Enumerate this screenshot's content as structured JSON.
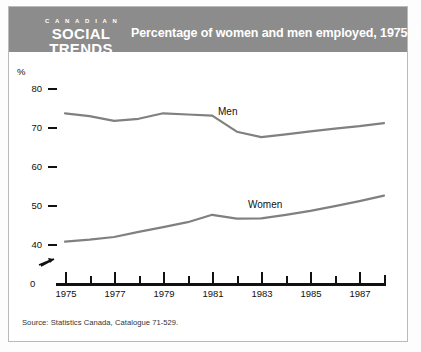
{
  "banner": {
    "logo_line1": "C A N A D I A N",
    "logo_line2": "SOCIAL",
    "logo_line3": "TRENDS",
    "title": "Percentage of women and men employed, 1975–1988",
    "background_color": "#8c8c8c",
    "text_color": "#ffffff"
  },
  "source": {
    "text": "Source: Statistics Canada, Catalogue 71-529."
  },
  "axis": {
    "y_unit": "%",
    "y_ticks": [
      "80",
      "70",
      "60",
      "50",
      "40"
    ],
    "zero_label": "0",
    "x_ticks_labeled": [
      "1975",
      "1977",
      "1979",
      "1981",
      "1983",
      "1985",
      "1987"
    ],
    "break_symbol": "axis-break"
  },
  "series_labels": {
    "men": "Men",
    "women": "Women"
  },
  "chart_data": {
    "type": "line",
    "title": "Percentage of women and men employed, 1975–1988",
    "xlabel": "",
    "ylabel": "%",
    "ylim": [
      40,
      80
    ],
    "xlim": [
      1975,
      1988
    ],
    "grid": false,
    "legend": "inline-labels",
    "axis_break": true,
    "x": [
      1975,
      1976,
      1977,
      1978,
      1979,
      1980,
      1981,
      1982,
      1983,
      1984,
      1985,
      1986,
      1987,
      1988
    ],
    "series": [
      {
        "name": "Men",
        "color": "#808080",
        "values": [
          73.5,
          72.8,
          71.6,
          72.1,
          73.5,
          73.2,
          72.9,
          68.8,
          67.4,
          68.1,
          68.9,
          69.6,
          70.2,
          71.0
        ]
      },
      {
        "name": "Women",
        "color": "#808080",
        "values": [
          40.6,
          41.1,
          41.8,
          43.1,
          44.3,
          45.6,
          47.5,
          46.5,
          46.6,
          47.5,
          48.5,
          49.7,
          51.0,
          52.4
        ]
      }
    ]
  }
}
